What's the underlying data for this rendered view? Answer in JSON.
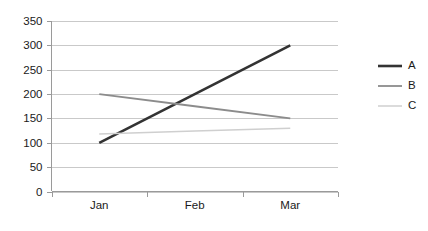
{
  "chart_data": {
    "type": "line",
    "title": "",
    "xlabel": "",
    "ylabel": "",
    "categories": [
      "Jan",
      "Feb",
      "Mar"
    ],
    "ylim": [
      0,
      350
    ],
    "ytick_values": [
      0,
      50,
      100,
      150,
      200,
      250,
      300,
      350
    ],
    "ytick_labels": [
      "0",
      "50",
      "100",
      "150",
      "200",
      "250",
      "300",
      "350"
    ],
    "grid": true,
    "legend_position": "right",
    "series": [
      {
        "name": "A",
        "values": [
          100,
          200,
          300
        ],
        "color": "#333333",
        "width": 2.6
      },
      {
        "name": "B",
        "values": [
          200,
          175,
          150
        ],
        "color": "#8c8c8c",
        "width": 1.8
      },
      {
        "name": "C",
        "values": [
          118,
          124,
          130
        ],
        "color": "#cfcfcf",
        "width": 1.5
      }
    ]
  },
  "legend": {
    "entries": [
      {
        "label": "A"
      },
      {
        "label": "B"
      },
      {
        "label": "C"
      }
    ]
  },
  "axes": {
    "y": {
      "labels": [
        "350",
        "300",
        "250",
        "200",
        "150",
        "100",
        "50",
        "0"
      ]
    },
    "x": {
      "labels": [
        "Jan",
        "Feb",
        "Mar"
      ]
    }
  },
  "colors": {
    "grid": "#c9c9c9",
    "axis": "#9a9a9a",
    "text": "#1a1a1a",
    "background": "#ffffff"
  }
}
